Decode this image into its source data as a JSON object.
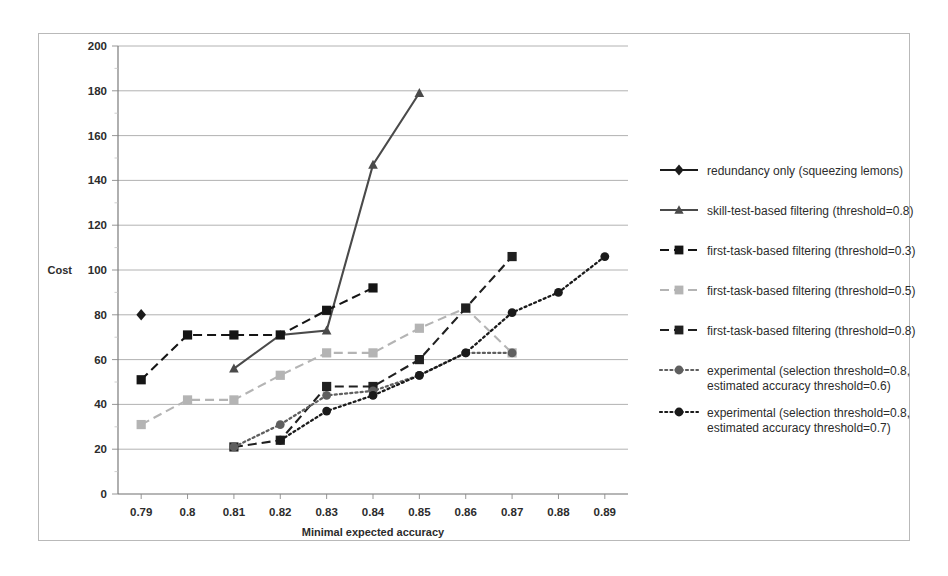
{
  "chart_data": {
    "type": "line",
    "title": "",
    "xlabel": "Minimal expected accuracy",
    "ylabel": "Cost",
    "x": [
      0.79,
      0.8,
      0.81,
      0.82,
      0.83,
      0.84,
      0.85,
      0.86,
      0.87,
      0.88,
      0.89
    ],
    "xtick_labels": [
      "0.79",
      "0.8",
      "0.81",
      "0.82",
      "0.83",
      "0.84",
      "0.85",
      "0.86",
      "0.87",
      "0.88",
      "0.89"
    ],
    "ytick_labels": [
      "0",
      "20",
      "40",
      "60",
      "80",
      "100",
      "120",
      "140",
      "160",
      "180",
      "200"
    ],
    "yticks": [
      0,
      20,
      40,
      60,
      80,
      100,
      120,
      140,
      160,
      180,
      200
    ],
    "ylim": [
      0,
      200
    ],
    "xlim": [
      0.785,
      0.895
    ],
    "grid": true,
    "legend_position": "right",
    "series": [
      {
        "name": "redundancy only (squeezing lemons)",
        "marker": "diamond",
        "dash": "solid",
        "color": "#1c1c1c",
        "points": [
          [
            0.79,
            80
          ]
        ]
      },
      {
        "name": "skill-test-based filtering (threshold=0.8)",
        "marker": "triangle",
        "dash": "solid",
        "color": "#4a4a4a",
        "points": [
          [
            0.81,
            56
          ],
          [
            0.82,
            71
          ],
          [
            0.83,
            73
          ],
          [
            0.84,
            147
          ],
          [
            0.85,
            179
          ]
        ]
      },
      {
        "name": "first-task-based filtering (threshold=0.3)",
        "marker": "square",
        "dash": "dashed",
        "color": "#151515",
        "points": [
          [
            0.79,
            51
          ],
          [
            0.8,
            71
          ],
          [
            0.81,
            71
          ],
          [
            0.82,
            71
          ],
          [
            0.83,
            82
          ],
          [
            0.84,
            92
          ]
        ]
      },
      {
        "name": "first-task-based filtering (threshold=0.5)",
        "marker": "square",
        "dash": "dashed",
        "color": "#b4b4b4",
        "points": [
          [
            0.79,
            31
          ],
          [
            0.8,
            42
          ],
          [
            0.81,
            42
          ],
          [
            0.82,
            53
          ],
          [
            0.83,
            63
          ],
          [
            0.84,
            63
          ],
          [
            0.85,
            74
          ],
          [
            0.86,
            83
          ],
          [
            0.87,
            63
          ]
        ]
      },
      {
        "name": "first-task-based filtering (threshold=0.8)",
        "marker": "square",
        "dash": "dashed",
        "color": "#202020",
        "points": [
          [
            0.81,
            21
          ],
          [
            0.82,
            24
          ],
          [
            0.83,
            48
          ],
          [
            0.84,
            48
          ],
          [
            0.85,
            60
          ],
          [
            0.86,
            83
          ],
          [
            0.87,
            106
          ]
        ]
      },
      {
        "name": "experimental (selection threshold=0.8, estimated accuracy threshold=0.6)",
        "marker": "circle",
        "dash": "dotted",
        "color": "#5f5f5f",
        "points": [
          [
            0.81,
            21
          ],
          [
            0.82,
            31
          ],
          [
            0.83,
            44
          ],
          [
            0.84,
            46
          ],
          [
            0.85,
            53
          ],
          [
            0.86,
            63
          ],
          [
            0.87,
            63
          ]
        ]
      },
      {
        "name": "experimental (selection threshold=0.8, estimated accuracy threshold=0.7)",
        "marker": "circle",
        "dash": "dotted",
        "color": "#1a1a1a",
        "points": [
          [
            0.82,
            24
          ],
          [
            0.83,
            37
          ],
          [
            0.84,
            44
          ],
          [
            0.85,
            53
          ],
          [
            0.86,
            63
          ],
          [
            0.87,
            81
          ],
          [
            0.88,
            90
          ],
          [
            0.89,
            106
          ]
        ]
      }
    ],
    "legend_entries": [
      {
        "lines": [
          "redundancy only (squeezing lemons)"
        ],
        "marker": "diamond",
        "dash": "solid",
        "color": "#1c1c1c"
      },
      {
        "lines": [
          "skill-test-based filtering (threshold=0.8)"
        ],
        "marker": "triangle",
        "dash": "solid",
        "color": "#4a4a4a"
      },
      {
        "lines": [
          "first-task-based filtering (threshold=0.3)"
        ],
        "marker": "square",
        "dash": "dashed",
        "color": "#151515"
      },
      {
        "lines": [
          "first-task-based filtering (threshold=0.5)"
        ],
        "marker": "square",
        "dash": "dashed",
        "color": "#b4b4b4"
      },
      {
        "lines": [
          "first-task-based filtering (threshold=0.8)"
        ],
        "marker": "square",
        "dash": "dashed",
        "color": "#202020"
      },
      {
        "lines": [
          "experimental (selection threshold=0.8,",
          "estimated accuracy threshold=0.6)"
        ],
        "marker": "circle",
        "dash": "dotted",
        "color": "#5f5f5f"
      },
      {
        "lines": [
          "experimental (selection threshold=0.8,",
          "estimated accuracy threshold=0.7)"
        ],
        "marker": "circle",
        "dash": "dotted",
        "color": "#1a1a1a"
      }
    ]
  }
}
